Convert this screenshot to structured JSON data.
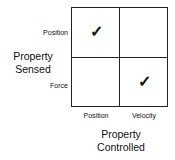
{
  "diagram": {
    "row_axis_title_line1": "Property",
    "row_axis_title_line2": "Sensed",
    "col_axis_title_line1": "Property",
    "col_axis_title_line2": "Controlled",
    "rows": [
      "Position",
      "Force"
    ],
    "columns": [
      "Position",
      "Velocity"
    ],
    "check_glyph": "✓",
    "cells": [
      {
        "row": "Position",
        "column": "Position",
        "checked": true
      },
      {
        "row": "Position",
        "column": "Velocity",
        "checked": false
      },
      {
        "row": "Force",
        "column": "Position",
        "checked": false
      },
      {
        "row": "Force",
        "column": "Velocity",
        "checked": true
      }
    ]
  }
}
